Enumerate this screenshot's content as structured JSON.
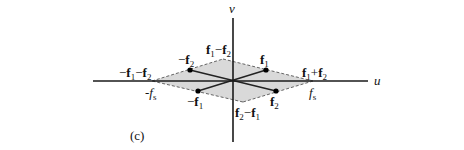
{
  "figure": {
    "panel_label": "(c)",
    "axes": {
      "u_label": "u",
      "v_label": "v",
      "origin": [
        233,
        81
      ],
      "u_axis": {
        "x1": 93,
        "x2": 368,
        "y": 81
      },
      "v_axis": {
        "x": 233,
        "y1": 18,
        "y2": 142
      }
    },
    "colors": {
      "fill": "#d9d9d9",
      "axis": "#1a1a1a",
      "line": "#222222",
      "dash": "#555555",
      "point": "#000000"
    },
    "region": {
      "vertices": [
        [
          152,
          81
        ],
        [
          223,
          59
        ],
        [
          313,
          81
        ],
        [
          243,
          102
        ]
      ]
    },
    "points": [
      {
        "id": "f1",
        "x": 266,
        "y": 70
      },
      {
        "id": "f2",
        "x": 276,
        "y": 91
      },
      {
        "id": "neg-f1",
        "x": 198,
        "y": 91
      },
      {
        "id": "neg-f2",
        "x": 190,
        "y": 70
      }
    ],
    "labels": {
      "f1": {
        "bold": "f",
        "sub": "1",
        "x": 260,
        "y": 64
      },
      "f2": {
        "bold": "f",
        "sub": "2",
        "x": 270,
        "y": 106
      },
      "neg_f1": {
        "text": "−",
        "bold": "f",
        "sub": "1",
        "x": 187,
        "y": 106
      },
      "neg_f2": {
        "text": "−",
        "bold": "f",
        "sub": "2",
        "x": 178,
        "y": 64
      },
      "f1_minus_f2": {
        "pre_bold": "f",
        "pre_sub": "1",
        "op": "−",
        "bold": "f",
        "sub": "2",
        "x": 206,
        "y": 54
      },
      "f2_minus_f1": {
        "pre_bold": "f",
        "pre_sub": "2",
        "op": "−",
        "bold": "f",
        "sub": "1",
        "x": 235,
        "y": 117
      },
      "f1_plus_f2": {
        "pre_bold": "f",
        "pre_sub": "1",
        "op": "+",
        "bold": "f",
        "sub": "2",
        "x": 302,
        "y": 77
      },
      "neg_f1_minus_f2": {
        "lead": "−",
        "pre_bold": "f",
        "pre_sub": "1",
        "op": "−",
        "bold": "f",
        "sub": "2",
        "x": 119,
        "y": 77
      },
      "fs_right": {
        "text": "f",
        "sub": "s",
        "x": 309,
        "y": 97
      },
      "fs_left": {
        "text": "-f",
        "sub": "s",
        "x": 145,
        "y": 97
      }
    }
  }
}
